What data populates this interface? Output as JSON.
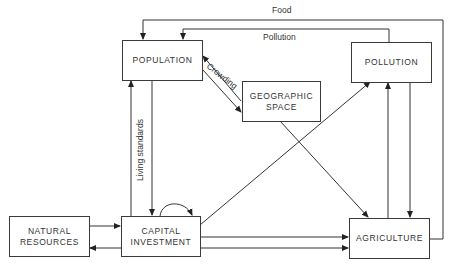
{
  "nodes": {
    "population": "POPULATION",
    "geographic_space_1": "GEOGRAPHIC",
    "geographic_space_2": "SPACE",
    "pollution": "POLLUTION",
    "natural_resources_1": "NATURAL",
    "natural_resources_2": "RESOURCES",
    "capital_investment_1": "CAPITAL",
    "capital_investment_2": "INVESTMENT",
    "agriculture": "AGRICULTURE"
  },
  "edge_labels": {
    "food": "Food",
    "pollution": "Pollution",
    "crowding": "Crowding",
    "living_standards": "Living standards"
  },
  "edges": [
    {
      "from": "AGRICULTURE",
      "to": "POPULATION",
      "label": "Food"
    },
    {
      "from": "POLLUTION",
      "to": "POPULATION",
      "label": "Pollution"
    },
    {
      "from": "POPULATION",
      "to": "GEOGRAPHIC SPACE",
      "label": "Crowding"
    },
    {
      "from": "GEOGRAPHIC SPACE",
      "to": "POPULATION"
    },
    {
      "from": "CAPITAL INVESTMENT",
      "to": "POPULATION",
      "label": "Living standards"
    },
    {
      "from": "POPULATION",
      "to": "CAPITAL INVESTMENT"
    },
    {
      "from": "CAPITAL INVESTMENT",
      "to": "CAPITAL INVESTMENT"
    },
    {
      "from": "NATURAL RESOURCES",
      "to": "CAPITAL INVESTMENT"
    },
    {
      "from": "CAPITAL INVESTMENT",
      "to": "NATURAL RESOURCES"
    },
    {
      "from": "CAPITAL INVESTMENT",
      "to": "POLLUTION"
    },
    {
      "from": "GEOGRAPHIC SPACE",
      "to": "AGRICULTURE"
    },
    {
      "from": "CAPITAL INVESTMENT",
      "to": "AGRICULTURE"
    },
    {
      "from": "CAPITAL INVESTMENT",
      "to": "AGRICULTURE"
    },
    {
      "from": "AGRICULTURE",
      "to": "POLLUTION"
    },
    {
      "from": "POLLUTION",
      "to": "AGRICULTURE"
    }
  ]
}
